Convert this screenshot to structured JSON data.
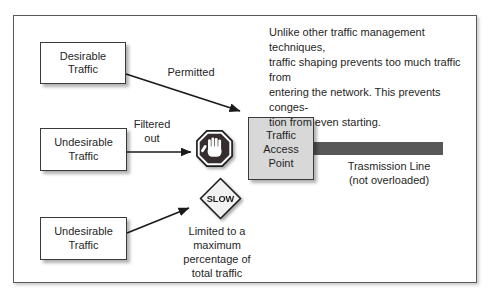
{
  "diagram": {
    "description": "Unlike other traffic management techniques,\ntraffic shaping prevents too much traffic from\nentering the network. This prevents conges-\ntion from even starting.",
    "nodes": {
      "desirable": "Desirable\nTraffic",
      "undesirable_top": "Undesirable\nTraffic",
      "undesirable_bottom": "Undesirable\nTraffic",
      "access_point": "Traffic\nAccess\nPoint"
    },
    "arrow_labels": {
      "permitted": "Permitted",
      "filtered_out": "Filtered\nout",
      "limited": "Limited to a\nmaximum\npercentage of\ntotal traffic"
    },
    "transmission_line_label": "Trasmission Line\n(not overloaded)",
    "signs": {
      "stop_icon": "stop-hand",
      "slow_label": "SLOW"
    },
    "colors": {
      "transmission_bar": "#575757",
      "access_point_fill": "#d8d8d8",
      "stop_sign_fill": "#362e2e",
      "sign_outline": "#1c1c1c",
      "slow_sign_fill": "#f2f2f2"
    }
  }
}
